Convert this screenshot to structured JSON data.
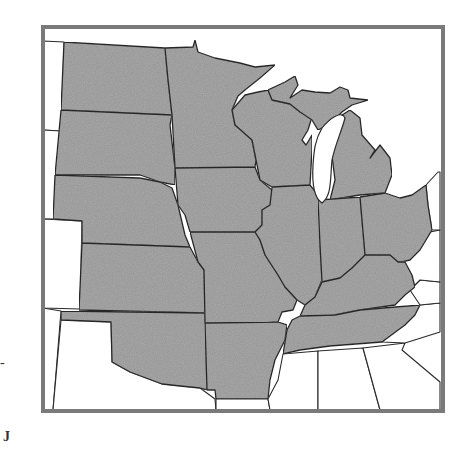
{
  "map": {
    "title": "",
    "region": "Midwestern United States",
    "colors": {
      "highlighted_fill": "#a9a9a9",
      "border": "#2a2a2a",
      "frame": "#7a7a7a",
      "background": "#ffffff"
    },
    "highlighted_states": [
      "North Dakota",
      "South Dakota",
      "Nebraska",
      "Kansas",
      "Oklahoma",
      "Minnesota",
      "Iowa",
      "Missouri",
      "Arkansas",
      "Wisconsin",
      "Illinois",
      "Michigan",
      "Indiana",
      "Ohio",
      "Kentucky",
      "Tennessee"
    ],
    "unhighlighted_states": [
      "Montana",
      "Wyoming",
      "Colorado",
      "New Mexico",
      "Texas",
      "Louisiana",
      "Mississippi",
      "Alabama",
      "Georgia",
      "North Carolina",
      "Virginia",
      "West Virginia",
      "Pennsylvania"
    ]
  },
  "page": {
    "margin_mark_left": "-",
    "corner_mark": "J"
  }
}
